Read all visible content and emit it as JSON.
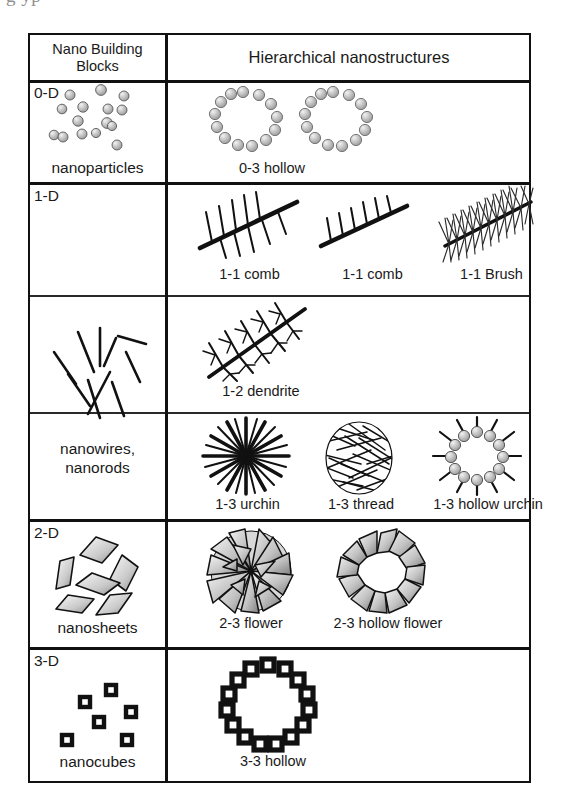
{
  "page": {
    "caption_remnant": "g         yp",
    "ink_color": "#111111",
    "background": "#ffffff"
  },
  "table": {
    "header": {
      "left": "Nano Building\nBlocks",
      "left_line1": "Nano Building",
      "left_line2": "Blocks",
      "right": "Hierarchical nanostructures"
    },
    "rows": [
      {
        "dimension": "0-D",
        "building_block": "nanoparticles",
        "building_block_icon": "scattered-spheres-icon",
        "subrows": [
          {
            "structures": [
              {
                "label": "0-3 hollow",
                "icon": "sphere-ring-icon"
              },
              {
                "label": "0-3 hollow",
                "icon": "sphere-ring-icon"
              }
            ],
            "label_text": "0-3 hollow",
            "label_count": 1
          }
        ]
      },
      {
        "dimension": "1-D",
        "building_block_line1": "nanowires,",
        "building_block_line2": "nanorods",
        "building_block_icon": "scattered-rods-icon",
        "subrows": [
          {
            "structures": [
              {
                "label": "1-1 comb",
                "icon": "comb-icon"
              },
              {
                "label": "1-1 comb",
                "icon": "comb-icon"
              },
              {
                "label": "1-1 Brush",
                "icon": "brush-icon"
              }
            ]
          },
          {
            "structures": [
              {
                "label": "1-2 dendrite",
                "icon": "dendrite-icon"
              }
            ]
          },
          {
            "structures": [
              {
                "label": "1-3 urchin",
                "icon": "urchin-icon"
              },
              {
                "label": "1-3 thread",
                "icon": "thread-ball-icon"
              },
              {
                "label": "1-3 hollow urchin",
                "icon": "hollow-urchin-icon"
              }
            ]
          }
        ]
      },
      {
        "dimension": "2-D",
        "building_block": "nanosheets",
        "building_block_icon": "scattered-sheets-icon",
        "subrows": [
          {
            "structures": [
              {
                "label": "2-3 flower",
                "icon": "flower-icon"
              },
              {
                "label": "2-3 hollow flower",
                "icon": "hollow-flower-icon"
              }
            ]
          }
        ]
      },
      {
        "dimension": "3-D",
        "building_block": "nanocubes",
        "building_block_icon": "scattered-cubes-icon",
        "subrows": [
          {
            "structures": [
              {
                "label": "3-3 hollow",
                "icon": "cube-ring-icon"
              }
            ]
          }
        ]
      }
    ]
  }
}
